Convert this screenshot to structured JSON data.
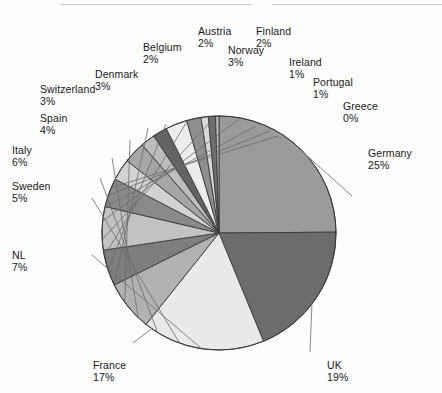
{
  "figure": {
    "background": "#fdfdfd",
    "top_rule_color": "#c9c9c9",
    "has_top_rule": true
  },
  "chart_data": {
    "type": "pie",
    "title": "",
    "subtitle": "",
    "xlabel": "",
    "ylabel": "",
    "legend_position": "none",
    "grid": false,
    "labels_show_percent": true,
    "units": "percent",
    "total": 100,
    "start_angle_deg": -90,
    "direction": "clockwise",
    "categories": [
      "Germany",
      "UK",
      "France",
      "NL",
      "Sweden",
      "Italy",
      "Spain",
      "Switzerland",
      "Denmark",
      "Belgium",
      "Austria",
      "Norway",
      "Finland",
      "Ireland",
      "Portugal",
      "Greece"
    ],
    "values": [
      25,
      19,
      17,
      7,
      5,
      6,
      4,
      3,
      3,
      2,
      2,
      3,
      2,
      1,
      1,
      0
    ],
    "slices": [
      {
        "name": "Germany",
        "percent": 25,
        "label": "Germany",
        "percent_text": "25%",
        "color": "#9b9b9b"
      },
      {
        "name": "UK",
        "percent": 19,
        "label": "UK",
        "percent_text": "19%",
        "color": "#6c6c6c"
      },
      {
        "name": "France",
        "percent": 17,
        "label": "France",
        "percent_text": "17%",
        "color": "#e9e9e9"
      },
      {
        "name": "NL",
        "percent": 7,
        "label": "NL",
        "percent_text": "7%",
        "color": "#b2b2b2"
      },
      {
        "name": "Sweden",
        "percent": 5,
        "label": "Sweden",
        "percent_text": "5%",
        "color": "#7e7e7e"
      },
      {
        "name": "Italy",
        "percent": 6,
        "label": "Italy",
        "percent_text": "6%",
        "color": "#c2c2c2"
      },
      {
        "name": "Spain",
        "percent": 4,
        "label": "Spain",
        "percent_text": "4%",
        "color": "#8a8a8a"
      },
      {
        "name": "Switzerland",
        "percent": 3,
        "label": "Switzerland",
        "percent_text": "3%",
        "color": "#d2d2d2"
      },
      {
        "name": "Denmark",
        "percent": 3,
        "label": "Denmark",
        "percent_text": "3%",
        "color": "#a6a6a6"
      },
      {
        "name": "Belgium",
        "percent": 2,
        "label": "Belgium",
        "percent_text": "2%",
        "color": "#bdbdbd"
      },
      {
        "name": "Austria",
        "percent": 2,
        "label": "Austria",
        "percent_text": "2%",
        "color": "#636363"
      },
      {
        "name": "Norway",
        "percent": 3,
        "label": "Norway",
        "percent_text": "3%",
        "color": "#ececec"
      },
      {
        "name": "Finland",
        "percent": 2,
        "label": "Finland",
        "percent_text": "2%",
        "color": "#8f8f8f"
      },
      {
        "name": "Ireland",
        "percent": 1,
        "label": "Ireland",
        "percent_text": "1%",
        "color": "#d8d8d8"
      },
      {
        "name": "Portugal",
        "percent": 1,
        "label": "Portugal",
        "percent_text": "1%",
        "color": "#6e6e6e"
      },
      {
        "name": "Greece",
        "percent": 0,
        "label": "Greece",
        "percent_text": "0%",
        "color": "#bababa"
      }
    ],
    "geometry": {
      "cx": 219,
      "cy": 233,
      "r": 117,
      "edge_color": "#3a3a3a",
      "leader_color": "#6a6a6a"
    },
    "callouts": [
      {
        "name": "Germany",
        "x": 368,
        "y": 148,
        "align": "l",
        "anchor_angle": 45,
        "elbow": [
          352,
          196
        ]
      },
      {
        "name": "UK",
        "x": 327,
        "y": 360,
        "align": "l",
        "anchor_angle": 127,
        "elbow": [
          310,
          352
        ]
      },
      {
        "name": "France",
        "x": 93,
        "y": 360,
        "align": "l",
        "anchor_angle": 215,
        "elbow": [
          133,
          343
        ]
      },
      {
        "name": "NL",
        "x": 12,
        "y": 250,
        "align": "l",
        "anchor_angle": 189,
        "elbow": [
          92,
          255
        ]
      },
      {
        "name": "Sweden",
        "x": 12,
        "y": 181,
        "align": "l",
        "anchor_angle": 200,
        "elbow": [
          92,
          198
        ]
      },
      {
        "name": "Italy",
        "x": 12,
        "y": 145,
        "align": "l",
        "anchor_angle": 212,
        "elbow": [
          100,
          178
        ]
      },
      {
        "name": "Spain",
        "x": 40,
        "y": 113,
        "align": "l",
        "anchor_angle": 224,
        "elbow": [
          112,
          158
        ]
      },
      {
        "name": "Switzerland",
        "x": 40,
        "y": 84,
        "align": "l",
        "anchor_angle": 234,
        "elbow": [
          130,
          140
        ]
      },
      {
        "name": "Denmark",
        "x": 95,
        "y": 69,
        "align": "l",
        "anchor_angle": 244,
        "elbow": [
          148,
          128
        ]
      },
      {
        "name": "Belgium",
        "x": 143,
        "y": 42,
        "align": "l",
        "anchor_angle": 252,
        "elbow": [
          166,
          124
        ]
      },
      {
        "name": "Austria",
        "x": 198,
        "y": 26,
        "align": "l",
        "anchor_angle": 259,
        "elbow": [
          188,
          120
        ]
      },
      {
        "name": "Norway",
        "x": 228,
        "y": 45,
        "align": "l",
        "anchor_angle": 267,
        "elbow": [
          214,
          118
        ]
      },
      {
        "name": "Finland",
        "x": 256,
        "y": 26,
        "align": "l",
        "anchor_angle": 276,
        "elbow": [
          238,
          120
        ]
      },
      {
        "name": "Ireland",
        "x": 289,
        "y": 57,
        "align": "l",
        "anchor_angle": 283,
        "elbow": [
          256,
          126
        ]
      },
      {
        "name": "Portugal",
        "x": 313,
        "y": 77,
        "align": "l",
        "anchor_angle": 289,
        "elbow": [
          270,
          131
        ]
      },
      {
        "name": "Greece",
        "x": 343,
        "y": 101,
        "align": "l",
        "anchor_angle": 293,
        "elbow": [
          278,
          136
        ]
      }
    ]
  }
}
